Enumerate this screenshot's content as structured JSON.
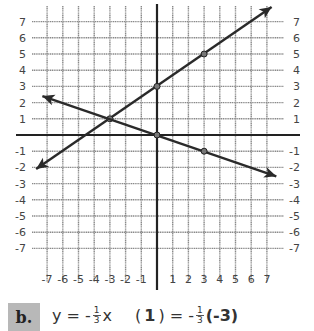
{
  "chart_data": {
    "type": "line",
    "title": "",
    "xlabel": "",
    "ylabel": "",
    "xlim": [
      -7,
      7
    ],
    "ylim": [
      -7,
      7
    ],
    "grid": true,
    "x_ticks": [
      "-7",
      "-6",
      "-5",
      "-4",
      "-3",
      "-2",
      "-1",
      "1",
      "2",
      "3",
      "4",
      "5",
      "6",
      "7"
    ],
    "y_ticks_left": [
      "7",
      "6",
      "5",
      "4",
      "3",
      "2",
      "1",
      "-1",
      "-2",
      "-3",
      "-4",
      "-5",
      "-6",
      "-7"
    ],
    "y_ticks_right": [
      "7",
      "6",
      "5",
      "4",
      "3",
      "2",
      "1",
      "-1",
      "-2",
      "-3",
      "-4",
      "-5",
      "-6",
      "-7"
    ],
    "series": [
      {
        "name": "y = 2/3 x + 3",
        "slope": 0.6667,
        "intercept": 3,
        "marked_points": [
          [
            -3,
            1
          ],
          [
            0,
            3
          ],
          [
            3,
            5
          ]
        ],
        "endpoints": [
          [
            -7.7,
            -2.1
          ],
          [
            7.3,
            7.9
          ]
        ],
        "arrows": "both"
      },
      {
        "name": "y = -1/3 x",
        "slope": -0.3333,
        "intercept": 0,
        "marked_points": [
          [
            0,
            0
          ],
          [
            3,
            -1
          ]
        ],
        "endpoints": [
          [
            -7.3,
            2.4
          ],
          [
            7.6,
            -2.55
          ]
        ],
        "arrows": "both"
      }
    ],
    "intersection": [
      -3,
      1
    ]
  },
  "footer": {
    "label": "b.",
    "equation": {
      "lhs": "y = -",
      "frac_num": "1",
      "frac_den": "3",
      "var": "x"
    },
    "substitution": {
      "open": "(",
      "y_value": "1",
      "close_eq": ") = -",
      "frac_num": "1",
      "frac_den": "3",
      "x_value": "(-3)"
    }
  },
  "colors": {
    "grid": "#8a8a8a",
    "axis": "#222222",
    "line": "#2a2a2a",
    "text": "#444444",
    "badge_bg": "#b8b8b8"
  }
}
